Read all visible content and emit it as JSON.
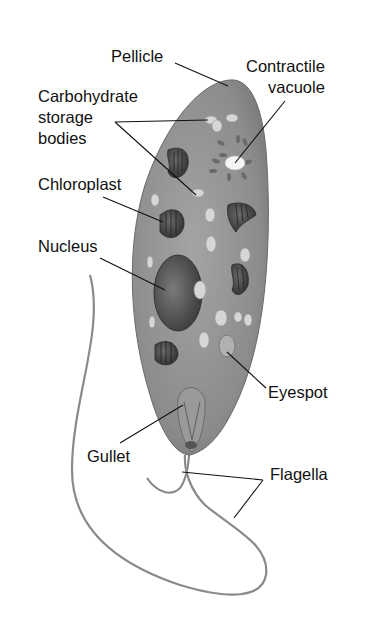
{
  "diagram": {
    "background": "#ffffff",
    "body_color": "#8a8a8a",
    "labels": [
      {
        "id": "pellicle",
        "text": "Pellicle",
        "x": 111,
        "y": 46
      },
      {
        "id": "contractile-vacuole",
        "text": "Contractile\nvacuole",
        "x": 246,
        "y": 56
      },
      {
        "id": "carbohydrate-storage-bodies",
        "text": "Carbohydrate\nstorage\nbodies",
        "x": 38,
        "y": 86
      },
      {
        "id": "chloroplast",
        "text": "Chloroplast",
        "x": 38,
        "y": 174
      },
      {
        "id": "nucleus",
        "text": "Nucleus",
        "x": 38,
        "y": 236
      },
      {
        "id": "eyespot",
        "text": "Eyespot",
        "x": 268,
        "y": 382
      },
      {
        "id": "gullet",
        "text": "Gullet",
        "x": 87,
        "y": 446
      },
      {
        "id": "flagella",
        "text": "Flagella",
        "x": 270,
        "y": 464
      }
    ]
  }
}
